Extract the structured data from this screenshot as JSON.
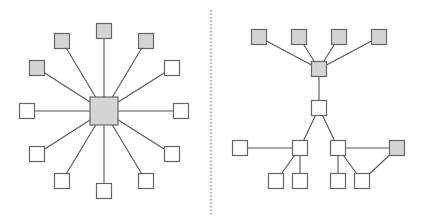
{
  "colors": {
    "background": "#ffffff",
    "edge": "#555555",
    "node_stroke": "#666666",
    "node_gray_fill": "#d4d4d4",
    "node_white_fill": "#ffffff",
    "divider": "#777777"
  },
  "divider": {
    "x": 211,
    "y1": 10,
    "y2": 215
  },
  "star_topology": {
    "hub": {
      "id": "hub",
      "cx": 104,
      "cy": 111,
      "size": 28,
      "fill": "gray"
    },
    "nodes": [
      {
        "id": "s-top",
        "cx": 104,
        "cy": 31,
        "size": 15,
        "fill": "gray"
      },
      {
        "id": "s-top-right",
        "cx": 146,
        "cy": 41,
        "size": 15,
        "fill": "gray"
      },
      {
        "id": "s-top-left",
        "cx": 62,
        "cy": 41,
        "size": 15,
        "fill": "gray"
      },
      {
        "id": "s-upper-left",
        "cx": 37,
        "cy": 68,
        "size": 15,
        "fill": "gray"
      },
      {
        "id": "s-upper-right",
        "cx": 172,
        "cy": 68,
        "size": 15,
        "fill": "white"
      },
      {
        "id": "s-left",
        "cx": 27,
        "cy": 111,
        "size": 15,
        "fill": "white"
      },
      {
        "id": "s-right",
        "cx": 181,
        "cy": 111,
        "size": 15,
        "fill": "white"
      },
      {
        "id": "s-lower-left",
        "cx": 37,
        "cy": 154,
        "size": 15,
        "fill": "white"
      },
      {
        "id": "s-lower-right",
        "cx": 172,
        "cy": 154,
        "size": 15,
        "fill": "white"
      },
      {
        "id": "s-bottom-left",
        "cx": 62,
        "cy": 181,
        "size": 15,
        "fill": "white"
      },
      {
        "id": "s-bottom-right",
        "cx": 146,
        "cy": 181,
        "size": 15,
        "fill": "white"
      },
      {
        "id": "s-bottom",
        "cx": 104,
        "cy": 191,
        "size": 15,
        "fill": "white"
      }
    ]
  },
  "tree_topology": {
    "nodes": [
      {
        "id": "t-top-1",
        "cx": 259,
        "cy": 37,
        "size": 15,
        "fill": "gray"
      },
      {
        "id": "t-top-2",
        "cx": 299,
        "cy": 37,
        "size": 15,
        "fill": "gray"
      },
      {
        "id": "t-top-3",
        "cx": 339,
        "cy": 37,
        "size": 15,
        "fill": "gray"
      },
      {
        "id": "t-top-4",
        "cx": 379,
        "cy": 37,
        "size": 15,
        "fill": "gray"
      },
      {
        "id": "t-hub",
        "cx": 319,
        "cy": 69,
        "size": 15,
        "fill": "gray"
      },
      {
        "id": "t-mid",
        "cx": 319,
        "cy": 108,
        "size": 15,
        "fill": "white"
      },
      {
        "id": "t-left-branch",
        "cx": 300,
        "cy": 148,
        "size": 15,
        "fill": "white"
      },
      {
        "id": "t-right-branch",
        "cx": 338,
        "cy": 148,
        "size": 15,
        "fill": "white"
      },
      {
        "id": "t-far-left",
        "cx": 240,
        "cy": 148,
        "size": 15,
        "fill": "white"
      },
      {
        "id": "t-far-right",
        "cx": 397,
        "cy": 148,
        "size": 15,
        "fill": "gray"
      },
      {
        "id": "t-leaf-1",
        "cx": 276,
        "cy": 181,
        "size": 15,
        "fill": "white"
      },
      {
        "id": "t-leaf-2",
        "cx": 300,
        "cy": 181,
        "size": 15,
        "fill": "white"
      },
      {
        "id": "t-leaf-3",
        "cx": 338,
        "cy": 181,
        "size": 15,
        "fill": "white"
      },
      {
        "id": "t-leaf-4",
        "cx": 362,
        "cy": 181,
        "size": 15,
        "fill": "white"
      }
    ],
    "edges": [
      [
        "t-top-1",
        "t-hub"
      ],
      [
        "t-top-2",
        "t-hub"
      ],
      [
        "t-top-3",
        "t-hub"
      ],
      [
        "t-top-4",
        "t-hub"
      ],
      [
        "t-hub",
        "t-mid"
      ],
      [
        "t-mid",
        "t-left-branch"
      ],
      [
        "t-mid",
        "t-right-branch"
      ],
      [
        "t-far-left",
        "t-left-branch"
      ],
      [
        "t-left-branch",
        "t-leaf-1"
      ],
      [
        "t-left-branch",
        "t-leaf-2"
      ],
      [
        "t-right-branch",
        "t-leaf-3"
      ],
      [
        "t-right-branch",
        "t-leaf-4"
      ],
      [
        "t-right-branch",
        "t-far-right"
      ],
      [
        "t-far-right",
        "t-leaf-4"
      ]
    ]
  }
}
